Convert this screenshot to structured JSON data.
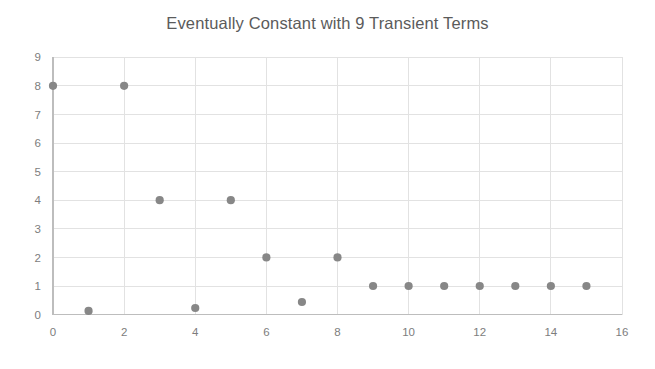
{
  "chart_data": {
    "type": "scatter",
    "title": "Eventually Constant with 9 Transient Terms",
    "xlabel": "",
    "ylabel": "",
    "xlim": [
      0,
      16
    ],
    "ylim": [
      0,
      9
    ],
    "xticks": [
      0,
      2,
      4,
      6,
      8,
      10,
      12,
      14,
      16
    ],
    "yticks": [
      0,
      1,
      2,
      3,
      4,
      5,
      6,
      7,
      8,
      9
    ],
    "xtick_labels": [
      "0",
      "2",
      "4",
      "6",
      "8",
      "10",
      "12",
      "14",
      "16"
    ],
    "ytick_labels": [
      "0",
      "1",
      "2",
      "3",
      "4",
      "5",
      "6",
      "7",
      "8",
      "9"
    ],
    "grid": true,
    "legend": false,
    "legend_position": "none",
    "marker_color": "#878787",
    "marker_size": 7,
    "x": [
      0,
      1,
      2,
      3,
      4,
      5,
      6,
      7,
      8,
      9,
      10,
      11,
      12,
      13,
      14,
      15
    ],
    "y": [
      8,
      0.13,
      8,
      4,
      0.23,
      4,
      2,
      0.44,
      2,
      1,
      1,
      1,
      1,
      1,
      1,
      1
    ],
    "points": [
      {
        "x": 0,
        "y": 8
      },
      {
        "x": 1,
        "y": 0.13
      },
      {
        "x": 2,
        "y": 8
      },
      {
        "x": 3,
        "y": 4
      },
      {
        "x": 4,
        "y": 0.23
      },
      {
        "x": 5,
        "y": 4
      },
      {
        "x": 6,
        "y": 2
      },
      {
        "x": 7,
        "y": 0.44
      },
      {
        "x": 8,
        "y": 2
      },
      {
        "x": 9,
        "y": 1
      },
      {
        "x": 10,
        "y": 1
      },
      {
        "x": 11,
        "y": 1
      },
      {
        "x": 12,
        "y": 1
      },
      {
        "x": 13,
        "y": 1
      },
      {
        "x": 14,
        "y": 1
      },
      {
        "x": 15,
        "y": 1
      }
    ]
  },
  "style": {
    "background": "#ffffff",
    "title_color": "#5b5b5b",
    "tick_color": "#7d7d7d",
    "grid_color": "#e2e2e2",
    "axis_color": "#bdbdbd"
  }
}
